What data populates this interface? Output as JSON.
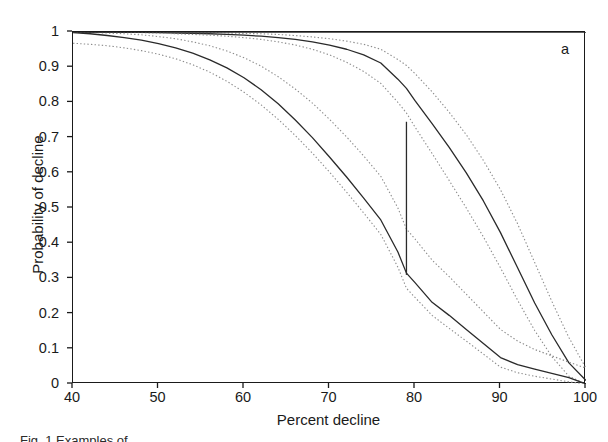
{
  "figure": {
    "panel_label": "a",
    "caption": "Fig. 1  Examples of ..."
  },
  "chart_data": {
    "type": "line",
    "title": "",
    "subtitle": "",
    "xlabel": "Percent decline",
    "ylabel": "Probability of decline",
    "xlim": [
      40,
      100
    ],
    "ylim": [
      0,
      1
    ],
    "xticks": [
      40,
      50,
      60,
      70,
      80,
      90,
      100
    ],
    "xtick_labels": [
      "40",
      "50",
      "60",
      "70",
      "80",
      "90",
      "100"
    ],
    "yticks": [
      0,
      0.1,
      0.2,
      0.3,
      0.4,
      0.5,
      0.6,
      0.7,
      0.8,
      0.9,
      1
    ],
    "ytick_labels": [
      "0",
      "0.1",
      "0.2",
      "0.3",
      "0.4",
      "0.5",
      "0.6",
      "0.7",
      "0.8",
      "0.9",
      "1"
    ],
    "grid": false,
    "legend": "none",
    "line_color": "#2a2a2a",
    "ci_color": "#8c8c8c",
    "frame_color": "#1a1a1a",
    "x": [
      40,
      42,
      44,
      46,
      48,
      50,
      52,
      54,
      56,
      58,
      60,
      62,
      64,
      66,
      68,
      70,
      72,
      74,
      76,
      78,
      79,
      80,
      82,
      84,
      86,
      88,
      90,
      92,
      94,
      96,
      98,
      100
    ],
    "series": [
      {
        "name": "upper-curve-fit",
        "style": "solid",
        "values": [
          1.0,
          1.0,
          1.0,
          0.999,
          0.999,
          0.998,
          0.997,
          0.996,
          0.995,
          0.993,
          0.991,
          0.988,
          0.984,
          0.979,
          0.972,
          0.963,
          0.951,
          0.935,
          0.912,
          0.866,
          0.84,
          0.805,
          0.74,
          0.672,
          0.6,
          0.52,
          0.43,
          0.33,
          0.23,
          0.14,
          0.06,
          0.01
        ]
      },
      {
        "name": "upper-curve-ci-upper",
        "style": "dotted",
        "values": [
          1.0,
          1.0,
          1.0,
          1.0,
          1.0,
          0.999,
          0.999,
          0.998,
          0.998,
          0.997,
          0.996,
          0.995,
          0.993,
          0.99,
          0.986,
          0.981,
          0.974,
          0.965,
          0.951,
          0.922,
          0.905,
          0.882,
          0.83,
          0.772,
          0.708,
          0.635,
          0.552,
          0.455,
          0.345,
          0.235,
          0.132,
          0.045
        ]
      },
      {
        "name": "upper-curve-ci-lower",
        "style": "dotted",
        "values": [
          1.0,
          1.0,
          0.999,
          0.999,
          0.998,
          0.997,
          0.995,
          0.993,
          0.991,
          0.988,
          0.984,
          0.979,
          0.972,
          0.963,
          0.951,
          0.935,
          0.914,
          0.888,
          0.854,
          0.8,
          0.77,
          0.73,
          0.655,
          0.578,
          0.5,
          0.418,
          0.33,
          0.238,
          0.152,
          0.078,
          0.022,
          0.0
        ]
      },
      {
        "name": "lower-curve-fit",
        "style": "solid",
        "values": [
          0.998,
          0.995,
          0.99,
          0.984,
          0.977,
          0.967,
          0.955,
          0.94,
          0.921,
          0.898,
          0.87,
          0.836,
          0.796,
          0.75,
          0.7,
          0.645,
          0.588,
          0.528,
          0.466,
          0.375,
          0.315,
          0.288,
          0.232,
          0.195,
          0.155,
          0.115,
          0.075,
          0.055,
          0.042,
          0.03,
          0.018,
          0.0
        ]
      },
      {
        "name": "lower-curve-ci-upper",
        "style": "dotted",
        "values": [
          1.0,
          0.999,
          0.997,
          0.995,
          0.992,
          0.987,
          0.981,
          0.972,
          0.961,
          0.946,
          0.927,
          0.903,
          0.873,
          0.838,
          0.798,
          0.752,
          0.702,
          0.648,
          0.59,
          0.5,
          0.44,
          0.412,
          0.352,
          0.305,
          0.255,
          0.205,
          0.155,
          0.122,
          0.098,
          0.08,
          0.062,
          0.045
        ]
      },
      {
        "name": "lower-curve-ci-lower",
        "style": "dotted",
        "values": [
          0.968,
          0.965,
          0.961,
          0.955,
          0.947,
          0.937,
          0.924,
          0.907,
          0.886,
          0.86,
          0.829,
          0.793,
          0.752,
          0.706,
          0.656,
          0.602,
          0.545,
          0.486,
          0.425,
          0.332,
          0.272,
          0.246,
          0.195,
          0.158,
          0.122,
          0.085,
          0.048,
          0.032,
          0.022,
          0.014,
          0.006,
          0.0
        ]
      },
      {
        "name": "second-upper-fit",
        "style": "solid",
        "values": [
          1.004,
          1.004,
          1.004,
          1.004,
          1.004,
          1.004,
          1.004,
          1.004,
          1.004,
          1.004,
          1.004,
          1.004,
          1.004,
          1.004,
          1.004,
          1.004,
          1.004,
          1.004,
          1.004,
          1.004,
          1.004,
          1.004,
          1.004,
          1.004,
          1.004,
          1.004,
          1.004,
          1.004,
          1.004,
          1.004,
          1.004,
          1.004
        ]
      }
    ],
    "annotations": [
      {
        "name": "vertical-reference-line",
        "type": "vline-segment",
        "x": 79,
        "y_top": 0.745,
        "y_bottom": 0.31
      }
    ]
  }
}
